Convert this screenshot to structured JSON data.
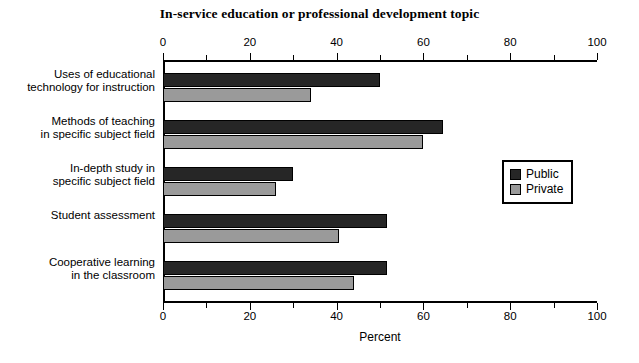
{
  "chart_data": {
    "type": "bar",
    "orientation": "horizontal",
    "title": "In-service education or professional development topic",
    "xlabel": "Percent",
    "ylabel": "",
    "xlim": [
      0,
      100
    ],
    "xticks": [
      0,
      20,
      40,
      60,
      80,
      100
    ],
    "xtick_labels": [
      "0",
      "20",
      "40",
      "60",
      "80",
      "100"
    ],
    "minor_tick_interval": 10,
    "grid": false,
    "dual_axis": true,
    "legend_position": "right-middle",
    "categories": [
      "Uses of educational\ntechnology for instruction",
      "Methods of teaching\nin specific subject field",
      "In-depth study in\nspecific subject field",
      "Student assessment",
      "Cooperative learning\nin the classroom"
    ],
    "series": [
      {
        "name": "Public",
        "color": "#262626",
        "values": [
          50,
          64.5,
          30,
          51.5,
          51.5
        ]
      },
      {
        "name": "Private",
        "color": "#9a9a9a",
        "values": [
          34,
          60,
          26,
          40.5,
          44
        ]
      }
    ]
  },
  "axis": {
    "top_labels": [
      "0",
      "20",
      "40",
      "60",
      "80",
      "100"
    ],
    "bottom_labels": [
      "0",
      "20",
      "40",
      "60",
      "80",
      "100"
    ],
    "x_title": "Percent"
  },
  "legend": {
    "items": [
      {
        "label": "Public",
        "color": "#262626"
      },
      {
        "label": "Private",
        "color": "#9a9a9a"
      }
    ]
  }
}
